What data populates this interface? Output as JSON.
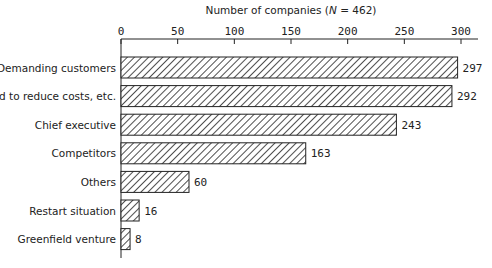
{
  "chart_data": {
    "type": "bar",
    "orientation": "horizontal",
    "title": "",
    "xlabel": "Number of companies (N = 462)",
    "xlabel_parts": {
      "prefix": "Number of companies (",
      "italic": "N",
      "suffix": " = 462)"
    },
    "ylabel": "",
    "xlim": [
      0,
      300
    ],
    "x_ticks": [
      0,
      50,
      100,
      150,
      200,
      250,
      300
    ],
    "axis_position": "top",
    "grid": false,
    "legend": null,
    "bar_fill": "diagonal-hatch",
    "categories": [
      "Demanding customers",
      "Need to reduce costs, etc.",
      "Chief executive",
      "Competitors",
      "Others",
      "Restart situation",
      "Greenfield venture"
    ],
    "values": [
      297,
      292,
      243,
      163,
      60,
      16,
      8
    ]
  },
  "colors": {
    "ink": "#222222",
    "background": "#ffffff"
  }
}
